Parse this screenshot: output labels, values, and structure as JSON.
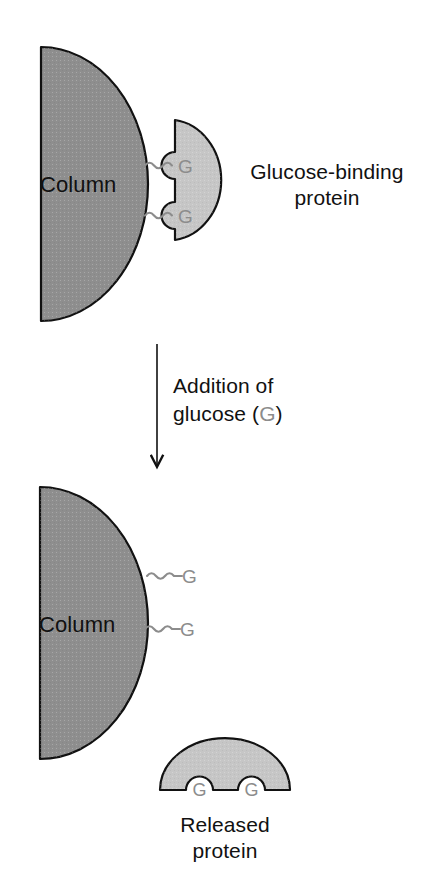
{
  "figure": {
    "background_color": "#ffffff",
    "colors": {
      "column_fill": "#8e8e8e",
      "protein_fill": "#c6c6c6",
      "outline": "#111111",
      "linker_gray": "#8c8c8c",
      "text_dark": "#111111",
      "text_gray": "#8c8c8c"
    }
  },
  "panel_top": {
    "column": {
      "label": "Column",
      "fill": "#8e8e8e"
    },
    "protein": {
      "caption_line1": "Glucose-binding",
      "caption_line2": "protein",
      "fill": "#c6c6c6"
    },
    "binding_sites": [
      {
        "label": "G",
        "linker": "wavy-linker-icon"
      },
      {
        "label": "G",
        "linker": "wavy-linker-icon"
      }
    ]
  },
  "transition": {
    "arrow": "down-arrow-icon",
    "text_line1": "Addition of",
    "text_line2_prefix": "glucose (",
    "text_line2_symbol": "G",
    "text_line2_suffix": ")"
  },
  "panel_bottom": {
    "column": {
      "label": "Column",
      "fill": "#8e8e8e"
    },
    "free_glucose": [
      {
        "label": "G",
        "linker": "wavy-linker-icon"
      },
      {
        "label": "G",
        "linker": "wavy-linker-icon"
      }
    ],
    "released_protein": {
      "caption_line1": "Released",
      "caption_line2": "protein",
      "fill": "#c6c6c6",
      "bound_sites": [
        {
          "label": "G"
        },
        {
          "label": "G"
        }
      ]
    }
  }
}
